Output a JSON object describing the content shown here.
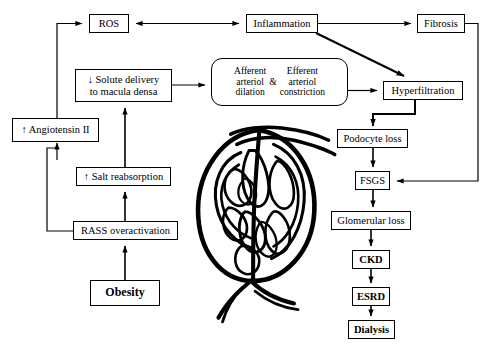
{
  "diagram": {
    "type": "flowchart",
    "background": "#ffffff",
    "stroke_color": "#000000",
    "nodes": [
      {
        "id": "ros",
        "label": "ROS",
        "x": 89,
        "y": 14,
        "w": 40,
        "h": 19,
        "shape": "rect",
        "bold": false
      },
      {
        "id": "inflammation",
        "label": "Inflammation",
        "x": 246,
        "y": 14,
        "w": 72,
        "h": 19,
        "shape": "rect",
        "bold": false
      },
      {
        "id": "fibrosis",
        "label": "Fibrosis",
        "x": 417,
        "y": 14,
        "w": 48,
        "h": 19,
        "shape": "rect",
        "bold": false
      },
      {
        "id": "solute",
        "label": "↓ Solute delivery\nto macula densa",
        "line1": "↓  Solute delivery",
        "line2": "to macula densa",
        "x": 75,
        "y": 69,
        "w": 97,
        "h": 33,
        "shape": "rect",
        "bold": false
      },
      {
        "id": "arteriole",
        "label": "Afferent arteriol dilation & Efferent arteriol constriction",
        "left_line1": "Afferent",
        "left_line2": "arteriol",
        "left_line3": "dilation",
        "amp": "&",
        "right_line1": "Efferent",
        "right_line2": "arteriol",
        "right_line3": "constriction",
        "x": 211,
        "y": 58,
        "w": 137,
        "h": 48,
        "shape": "rounded",
        "bold": false
      },
      {
        "id": "hyperfiltration",
        "label": "Hyperfiltration",
        "x": 383,
        "y": 81,
        "w": 80,
        "h": 19,
        "shape": "rect",
        "bold": false
      },
      {
        "id": "angiotensin",
        "label": "↑ Angiotensin II",
        "x": 12,
        "y": 118,
        "w": 87,
        "h": 24,
        "shape": "rect",
        "bold": false
      },
      {
        "id": "podocyte",
        "label": "Podocyte loss",
        "x": 337,
        "y": 129,
        "w": 71,
        "h": 19,
        "shape": "rect",
        "bold": false
      },
      {
        "id": "salt",
        "label": "↑ Salt reabsorption",
        "x": 76,
        "y": 167,
        "w": 95,
        "h": 19,
        "shape": "rect",
        "bold": false
      },
      {
        "id": "fsgs",
        "label": "FSGS",
        "x": 355,
        "y": 171,
        "w": 35,
        "h": 19,
        "shape": "rect",
        "bold": false
      },
      {
        "id": "rass",
        "label": "RASS overactivation",
        "x": 73,
        "y": 221,
        "w": 105,
        "h": 19,
        "shape": "rect",
        "bold": false
      },
      {
        "id": "glomerular",
        "label": "Glomerular loss",
        "x": 331,
        "y": 211,
        "w": 80,
        "h": 19,
        "shape": "rect",
        "bold": false
      },
      {
        "id": "ckd",
        "label": "CKD",
        "x": 352,
        "y": 250,
        "w": 38,
        "h": 19,
        "shape": "rect",
        "bold": true
      },
      {
        "id": "obesity",
        "label": "Obesity",
        "x": 90,
        "y": 280,
        "w": 70,
        "h": 26,
        "shape": "rect",
        "bold": true
      },
      {
        "id": "esrd",
        "label": "ESRD",
        "x": 352,
        "y": 287,
        "w": 38,
        "h": 19,
        "shape": "rect",
        "bold": true
      },
      {
        "id": "dialysis",
        "label": "Dialysis",
        "x": 348,
        "y": 320,
        "w": 47,
        "h": 19,
        "shape": "rect",
        "bold": true
      }
    ],
    "edges": [
      {
        "from": "inflammation",
        "to": "ros",
        "style": "double-arrow",
        "desc": "inflammation-ros-bidirectional"
      },
      {
        "from": "inflammation",
        "to": "fibrosis",
        "style": "arrow",
        "desc": "inflammation-to-fibrosis"
      },
      {
        "from": "inflammation",
        "to": "hyperfiltration",
        "style": "diagonal-arrow",
        "desc": "inflammation-to-hyperfiltration"
      },
      {
        "from": "fibrosis",
        "to": "fsgs",
        "style": "elbow-arrow",
        "desc": "fibrosis-to-fsgs"
      },
      {
        "from": "angiotensin",
        "to": "ros",
        "style": "elbow-arrow",
        "desc": "angiotensin-to-ros"
      },
      {
        "from": "salt",
        "to": "solute",
        "style": "arrow",
        "desc": "salt-to-solute"
      },
      {
        "from": "solute",
        "to": "arteriole",
        "style": "arrow",
        "desc": "solute-to-arteriole"
      },
      {
        "from": "arteriole",
        "to": "hyperfiltration",
        "style": "arrow",
        "desc": "arteriole-to-hyperfiltration"
      },
      {
        "from": "hyperfiltration",
        "to": "podocyte",
        "style": "elbow-arrow",
        "desc": "hyperfiltration-to-podocyte"
      },
      {
        "from": "podocyte",
        "to": "fsgs",
        "style": "arrow",
        "desc": "podocyte-to-fsgs"
      },
      {
        "from": "fsgs",
        "to": "glomerular",
        "style": "arrow",
        "desc": "fsgs-to-glomerular"
      },
      {
        "from": "glomerular",
        "to": "ckd",
        "style": "arrow",
        "desc": "glomerular-to-ckd"
      },
      {
        "from": "ckd",
        "to": "esrd",
        "style": "arrow",
        "desc": "ckd-to-esrd"
      },
      {
        "from": "esrd",
        "to": "dialysis",
        "style": "arrow",
        "desc": "esrd-to-dialysis"
      },
      {
        "from": "obesity",
        "to": "rass",
        "style": "arrow",
        "desc": "obesity-to-rass"
      },
      {
        "from": "rass",
        "to": "salt",
        "style": "arrow",
        "desc": "rass-to-salt"
      },
      {
        "from": "rass",
        "to": "angiotensin",
        "style": "elbow-arrow",
        "desc": "rass-to-angiotensin"
      },
      {
        "from": "angiotensin-branch",
        "to": "solute",
        "style": "line",
        "desc": "angiotensin-line-to-solute-region"
      }
    ],
    "illustration": {
      "name": "glomerulus",
      "x": 185,
      "y": 120,
      "w": 150,
      "h": 170,
      "description": "line drawing of a kidney glomerulus with capillary loops"
    }
  }
}
